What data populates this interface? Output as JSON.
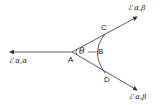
{
  "diagram": {
    "points": {
      "A": "A",
      "B": "B",
      "C": "C",
      "D": "D"
    },
    "angle_label": "θ",
    "vectors": {
      "upper": "ℰ α,β",
      "left": "ℰ α,α",
      "lower": "ℰ α,β"
    },
    "stroke_color": "#333333"
  }
}
